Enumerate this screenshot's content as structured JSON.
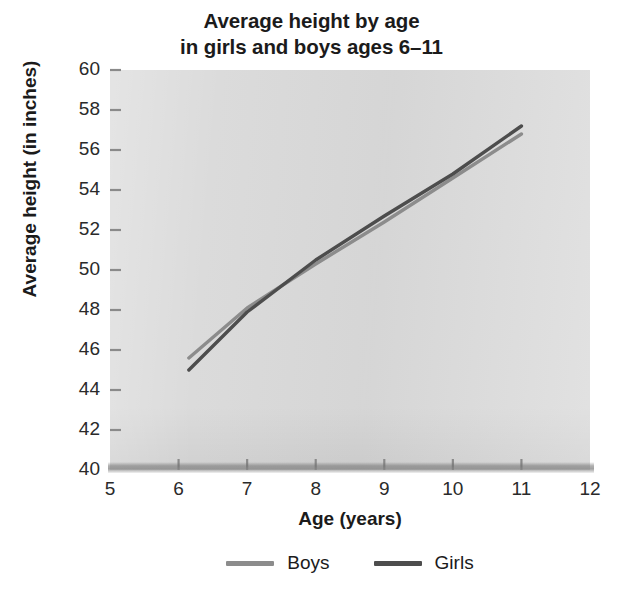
{
  "chart_data": {
    "type": "line",
    "title_lines": [
      "Average height by age",
      "in girls and boys ages 6–11"
    ],
    "xlabel": "Age (years)",
    "ylabel": "Average height (in inches)",
    "xlim": [
      5,
      12
    ],
    "ylim": [
      40,
      60
    ],
    "xticks": [
      5,
      6,
      7,
      8,
      9,
      10,
      11,
      12
    ],
    "yticks": [
      40,
      42,
      44,
      46,
      48,
      50,
      52,
      54,
      56,
      58,
      60
    ],
    "grid": false,
    "legend_position": "below",
    "plot_background": "#d9d9d9",
    "x": [
      6.15,
      7,
      8,
      9,
      10,
      11
    ],
    "series": [
      {
        "name": "Boys",
        "color": "#8c8c8c",
        "values": [
          45.6,
          48.1,
          50.3,
          52.4,
          54.6,
          56.8
        ]
      },
      {
        "name": "Girls",
        "color": "#4d4d4d",
        "values": [
          45.0,
          47.9,
          50.5,
          52.7,
          54.8,
          57.2
        ]
      }
    ]
  },
  "axis": {
    "y_tick_labels": [
      "60",
      "58",
      "56",
      "54",
      "52",
      "50",
      "48",
      "46",
      "44",
      "42",
      "40"
    ],
    "x_tick_labels": [
      "5",
      "6",
      "7",
      "8",
      "9",
      "10",
      "11",
      "12"
    ]
  },
  "legend": {
    "items": [
      {
        "label": "Boys",
        "color": "#8c8c8c"
      },
      {
        "label": "Girls",
        "color": "#4d4d4d"
      }
    ]
  }
}
